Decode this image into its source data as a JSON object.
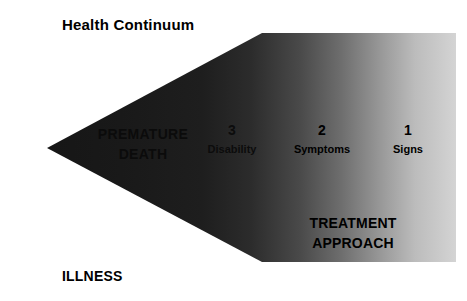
{
  "figure": {
    "title": "Health Continuum",
    "bottom_label": "ILLNESS",
    "treatment": {
      "line1": "TREATMENT",
      "line2": "APPROACH"
    },
    "premature_death": {
      "line1": "PREMATURE",
      "line2": "DEATH"
    },
    "stages": [
      {
        "number": "3",
        "name": "Disability"
      },
      {
        "number": "2",
        "name": "Symptoms"
      },
      {
        "number": "1",
        "name": "Signs"
      }
    ],
    "colors": {
      "background": "#ffffff",
      "text": "#000000",
      "gradient_dark": "#191919",
      "gradient_mid": "#5a5a5a",
      "gradient_light": "#d2d2d2"
    }
  }
}
